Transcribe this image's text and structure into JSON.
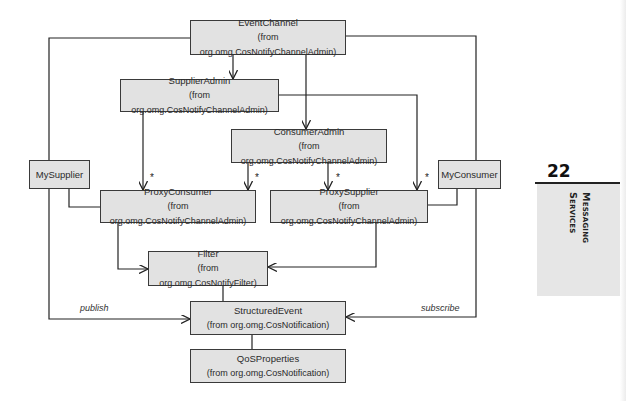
{
  "diagram": {
    "type": "UML class diagram",
    "classes": [
      {
        "id": "event-channel",
        "name": "EventChannel",
        "package": "(from org.omg.CosNotifyChannelAdmin)"
      },
      {
        "id": "supplier-admin",
        "name": "SupplierAdmin",
        "package": "(from org.omg.CosNotifyChannelAdmin)"
      },
      {
        "id": "consumer-admin",
        "name": "ConsumerAdmin",
        "package": "(from org.omg.CosNotifyChannelAdmin)"
      },
      {
        "id": "my-supplier",
        "name": "MySupplier",
        "package": ""
      },
      {
        "id": "proxy-consumer",
        "name": "ProxyConsumer",
        "package": "(from org.omg.CosNotifyChannelAdmin)"
      },
      {
        "id": "proxy-supplier",
        "name": "ProxySupplier",
        "package": "(from org.omg.CosNotifyChannelAdmin)"
      },
      {
        "id": "my-consumer",
        "name": "MyConsumer",
        "package": ""
      },
      {
        "id": "filter",
        "name": "Filter",
        "package": "(from org.omg.CosNotifyFilter)"
      },
      {
        "id": "structured-event",
        "name": "StructuredEvent",
        "package": "(from org.omg.CosNotification)"
      },
      {
        "id": "qos-properties",
        "name": "QoSProperties",
        "package": "(from org.omg.CosNotification)"
      }
    ],
    "multiplicities": [
      "*",
      "*",
      "*",
      "*"
    ],
    "edge_labels": {
      "publish": "publish",
      "subscribe": "subscribe"
    }
  },
  "chapter": {
    "number": "22",
    "title_line1": "Messaging",
    "title_line2": "Services"
  }
}
